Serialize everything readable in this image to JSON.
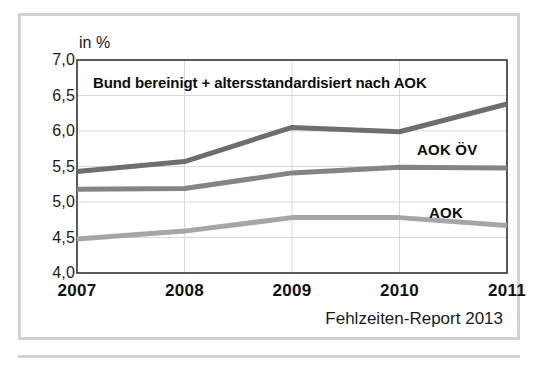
{
  "figure": {
    "unit_label": "in %",
    "plot_title": "Bund bereinigt + altersstandardisiert nach AOK",
    "source_note": "Fehlzeiten-Report 2013",
    "border_color": "#d2d2d2",
    "background_color": "#ffffff"
  },
  "chart_data": {
    "type": "line",
    "title": "Bund bereinigt + altersstandardisiert nach AOK",
    "xlabel": "",
    "ylabel": "in %",
    "ylim": [
      4.0,
      7.0
    ],
    "yticks": [
      4.0,
      4.5,
      5.0,
      5.5,
      6.0,
      6.5,
      7.0
    ],
    "ytick_labels": [
      "4,0",
      "4,5",
      "5,0",
      "5,5",
      "6,0",
      "6,5",
      "7,0"
    ],
    "categories": [
      "2007",
      "2008",
      "2009",
      "2010",
      "2011"
    ],
    "x": [
      2007,
      2008,
      2009,
      2010,
      2011
    ],
    "grid": true,
    "legend_position": "inline-right",
    "series": [
      {
        "name": "Bund bereinigt + altersstandardisiert nach AOK",
        "values": [
          5.43,
          5.57,
          6.05,
          5.99,
          6.38
        ],
        "color": "#6e6e6e"
      },
      {
        "name": "AOK ÖV",
        "values": [
          5.18,
          5.19,
          5.41,
          5.49,
          5.48
        ],
        "color": "#848484"
      },
      {
        "name": "AOK",
        "values": [
          4.48,
          4.59,
          4.78,
          4.78,
          4.67
        ],
        "color": "#a6a6a6"
      }
    ],
    "annotations": [
      {
        "text": "AOK ÖV",
        "series": "AOK ÖV"
      },
      {
        "text": "AOK",
        "series": "AOK"
      }
    ]
  }
}
